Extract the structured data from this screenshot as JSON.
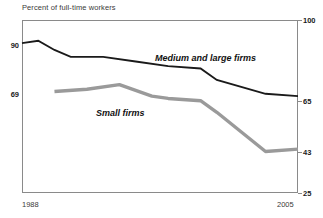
{
  "chart_data": {
    "type": "line",
    "title": "Percent of full-time workers",
    "xlabel": "",
    "ylabel": "",
    "grid": false,
    "legend_position": "inline-annotation",
    "xlim": [
      1988,
      2005
    ],
    "x_tick_labels": [
      "1988",
      "2005"
    ],
    "left_axis": {
      "tick_labels": [
        "90",
        "69"
      ],
      "tick_values": [
        90,
        69
      ]
    },
    "right_axis": {
      "tick_labels": [
        "100",
        "65",
        "43",
        "25"
      ],
      "tick_values": [
        100,
        65,
        43,
        25
      ],
      "ylim": [
        25,
        100
      ]
    },
    "series": [
      {
        "name": "Medium and large firms",
        "color": "#1a1a1a",
        "x": [
          1988,
          1989,
          1990,
          1991,
          1993,
          1995,
          1997,
          1999,
          2000,
          2003,
          2005
        ],
        "values": [
          90,
          91,
          87,
          84,
          84,
          82,
          80,
          79,
          74,
          68,
          67
        ]
      },
      {
        "name": "Small firms",
        "color": "#9a9a9a",
        "x": [
          1990,
          1992,
          1994,
          1996,
          1997,
          1999,
          2000,
          2003,
          2005
        ],
        "values": [
          69,
          70,
          72,
          67,
          66,
          65,
          60,
          43,
          44
        ]
      }
    ],
    "annotations": [
      {
        "text": "Medium and large firms",
        "x": 1996,
        "y": 82
      },
      {
        "text": "Small firms",
        "x": 1992,
        "y": 60
      }
    ]
  }
}
